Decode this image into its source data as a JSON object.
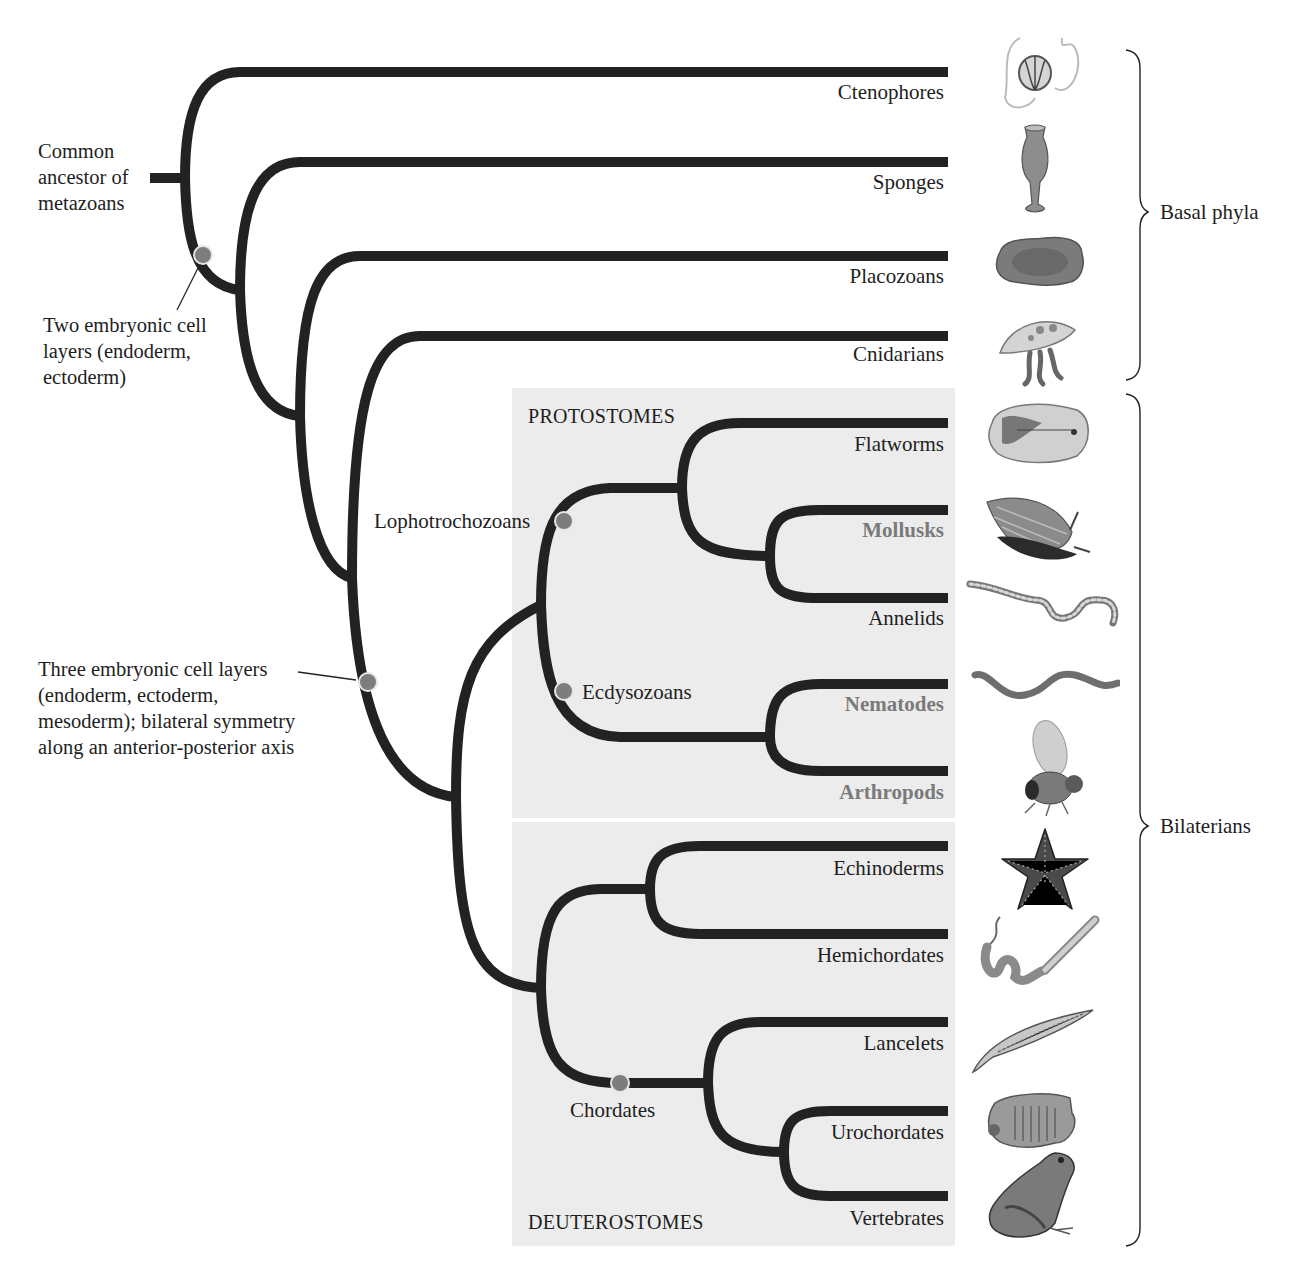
{
  "diagram": {
    "type": "phylogenetic-tree",
    "colors": {
      "branch": "#222222",
      "node_marker": "#7d7d7d",
      "node_marker_outline": "#e6e6e6",
      "panel_background": "#ececec",
      "highlighted_taxon": "#7a7a7a"
    },
    "root_label": {
      "line1": "Common",
      "line2": "ancestor of",
      "line3": "metazoans"
    },
    "annotations": {
      "two_layers": {
        "line1": "Two embryonic cell",
        "line2": "layers (endoderm,",
        "line3": "ectoderm)"
      },
      "three_layers": {
        "line1": "Three embryonic cell layers",
        "line2": "(endoderm, ectoderm,",
        "line3": "mesoderm); bilateral symmetry",
        "line4": "along an anterior-posterior axis"
      }
    },
    "groups": {
      "protostomes": "PROTOSTOMES",
      "deuterostomes": "DEUTEROSTOMES",
      "lophotrochozoans": "Lophotrochozoans",
      "ecdysozoans": "Ecdysozoans",
      "chordates": "Chordates"
    },
    "taxa": [
      {
        "name": "Ctenophores",
        "highlight": false,
        "icon": "ctenophore-icon"
      },
      {
        "name": "Sponges",
        "highlight": false,
        "icon": "sponge-icon"
      },
      {
        "name": "Placozoans",
        "highlight": false,
        "icon": "placozoan-icon"
      },
      {
        "name": "Cnidarians",
        "highlight": false,
        "icon": "jellyfish-icon"
      },
      {
        "name": "Flatworms",
        "highlight": false,
        "icon": "flatworm-icon"
      },
      {
        "name": "Mollusks",
        "highlight": true,
        "icon": "snail-icon"
      },
      {
        "name": "Annelids",
        "highlight": false,
        "icon": "earthworm-icon"
      },
      {
        "name": "Nematodes",
        "highlight": true,
        "icon": "nematode-icon"
      },
      {
        "name": "Arthropods",
        "highlight": true,
        "icon": "fruit-fly-icon"
      },
      {
        "name": "Echinoderms",
        "highlight": false,
        "icon": "starfish-icon"
      },
      {
        "name": "Hemichordates",
        "highlight": false,
        "icon": "acorn-worm-icon"
      },
      {
        "name": "Lancelets",
        "highlight": false,
        "icon": "lancelet-icon"
      },
      {
        "name": "Urochordates",
        "highlight": false,
        "icon": "sea-squirt-icon"
      },
      {
        "name": "Vertebrates",
        "highlight": false,
        "icon": "frog-icon"
      }
    ],
    "brackets": {
      "basal": "Basal phyla",
      "bilaterians": "Bilaterians"
    }
  }
}
